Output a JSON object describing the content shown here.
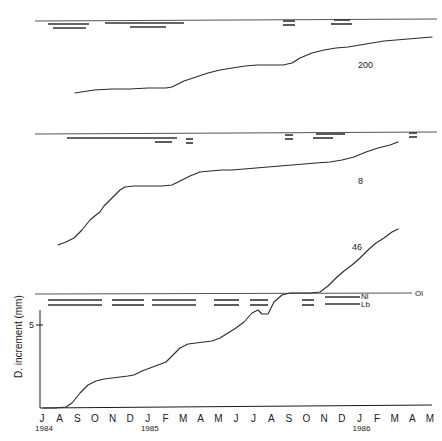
{
  "figure": {
    "name": "diameter-increment-phenology-figure",
    "panel_count": 3,
    "axis": {
      "ylabel": "D. increment (mm)",
      "ytick_label": "5",
      "ytick_value": 5,
      "ylim": [
        0,
        7
      ],
      "xlim": [
        0,
        22
      ],
      "grid": false
    },
    "xaxis": {
      "months": [
        "J",
        "A",
        "S",
        "O",
        "N",
        "D",
        "J",
        "F",
        "M",
        "A",
        "M",
        "J",
        "J",
        "A",
        "S",
        "O",
        "N",
        "D",
        "J",
        "F",
        "M",
        "A",
        "M"
      ],
      "years": [
        {
          "label": "1984",
          "index": 0
        },
        {
          "label": "1985",
          "index": 6
        },
        {
          "label": "1986",
          "index": 18
        }
      ]
    },
    "phenology_legend": [
      {
        "code": "Ol",
        "name": "old-leaves"
      },
      {
        "code": "Nl",
        "name": "new-leaves"
      },
      {
        "code": "Lb",
        "name": "leaf-buds"
      }
    ]
  },
  "chart_data": {
    "type": "line",
    "title": "",
    "xlabel": "",
    "ylabel": "D. increment (mm)",
    "ylim": [
      0,
      7
    ],
    "ytick_labels": [
      "5"
    ],
    "x": [
      "J 1984",
      "A",
      "S",
      "O",
      "N",
      "D",
      "J 1985",
      "F",
      "M",
      "A",
      "M",
      "J",
      "J",
      "A",
      "S",
      "O",
      "N",
      "D",
      "J 1986",
      "F",
      "M",
      "A",
      "M"
    ],
    "panels": [
      {
        "panel": 1,
        "series_label": "200",
        "values": [
          null,
          0.55,
          0.55,
          0.58,
          0.6,
          0.62,
          0.63,
          0.7,
          0.95,
          1.2,
          1.45,
          1.6,
          1.78,
          1.85,
          1.9,
          1.92,
          2.05,
          2.4,
          2.7,
          3.0,
          3.05,
          3.35,
          3.6
        ],
        "phenology": {
          "Ol": [
            [
              0.4,
              22.2
            ]
          ],
          "Nl": [
            [
              1.1,
              3.1
            ],
            [
              4.1,
              8.4
            ],
            [
              14.3,
              14.9
            ],
            [
              17.1,
              17.7
            ]
          ],
          "Lb": [
            [
              1.4,
              2.9
            ],
            [
              5.3,
              7.6
            ],
            [
              14.3,
              14.9
            ],
            [
              17.2,
              17.9
            ]
          ]
        }
      },
      {
        "panel": 2,
        "series_label": "8",
        "values": [
          null,
          0.1,
          0.25,
          0.7,
          1.05,
          1.55,
          2.3,
          2.45,
          2.48,
          2.5,
          2.8,
          3.15,
          3.45,
          3.55,
          3.7,
          3.78,
          3.85,
          3.95,
          4.05,
          4.2,
          4.55,
          4.9,
          5.2
        ],
        "phenology": {
          "Ol": [
            [
              0.4,
              22.5
            ]
          ],
          "Nl": [
            [
              1.7,
              8.3
            ],
            [
              9.3,
              9.8
            ],
            [
              14.3,
              14.9
            ],
            [
              16.1,
              17.6
            ],
            [
              22.0,
              22.5
            ]
          ],
          "Lb": [
            [
              7.4,
              8.6
            ],
            [
              9.3,
              9.8
            ],
            [
              14.3,
              14.9
            ],
            [
              15.9,
              16.7
            ],
            [
              22.0,
              22.5
            ]
          ]
        }
      },
      {
        "panel": 3,
        "series_label": "46",
        "values": [
          0.0,
          0.0,
          0.02,
          0.3,
          0.62,
          0.8,
          0.9,
          1.0,
          1.3,
          1.65,
          1.72,
          1.75,
          2.05,
          2.35,
          2.7,
          3.75,
          3.9,
          3.9,
          4.15,
          4.6,
          5.0,
          5.5,
          5.6
        ],
        "phenology": {
          "Ol": [
            [
              0.4,
              22.2
            ]
          ],
          "Nl": [
            [
              0.9,
              3.8
            ],
            [
              4.5,
              6.2
            ],
            [
              6.7,
              9.3
            ],
            [
              10.3,
              11.7
            ],
            [
              12.3,
              13.3
            ],
            [
              15.3,
              15.9
            ],
            [
              16.5,
              18.6
            ]
          ],
          "Lb": [
            [
              0.9,
              3.8
            ],
            [
              4.5,
              6.2
            ],
            [
              6.7,
              9.3
            ],
            [
              10.3,
              11.7
            ],
            [
              12.3,
              13.3
            ],
            [
              15.3,
              15.9
            ],
            [
              16.5,
              18.6
            ]
          ]
        }
      }
    ]
  }
}
